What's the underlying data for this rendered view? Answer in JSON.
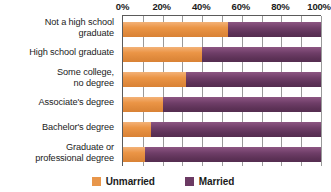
{
  "chart_data": {
    "type": "bar",
    "orientation": "horizontal",
    "stacked": true,
    "stack_total": 100,
    "title": "",
    "subtitle": "",
    "xlabel": "",
    "ylabel": "",
    "xlim": [
      0,
      100
    ],
    "grid": true,
    "grid_interval": 10,
    "tick_interval": 20,
    "axis_unit": "%",
    "legend_position": "bottom-center",
    "tick_labels": [
      "0%",
      "20%",
      "40%",
      "60%",
      "80%",
      "100%"
    ],
    "tick_values": [
      0,
      20,
      40,
      60,
      80,
      100
    ],
    "gridline_values": [
      0,
      10,
      20,
      30,
      40,
      50,
      60,
      70,
      80,
      90,
      100
    ],
    "categories": [
      "Not a high school graduate",
      "High school graduate",
      "Some college, no degree",
      "Associate's degree",
      "Bachelor's degree",
      "Graduate or professional degree"
    ],
    "category_label_lines": [
      [
        "Not a high school",
        "graduate"
      ],
      [
        "High school graduate"
      ],
      [
        "Some college,",
        "no degree"
      ],
      [
        "Associate's degree"
      ],
      [
        "Bachelor's degree"
      ],
      [
        "Graduate or",
        "professional degree"
      ]
    ],
    "series": [
      {
        "name": "Unmarried",
        "color": "#e8964a",
        "values": [
          53,
          40,
          32,
          20,
          14,
          11
        ]
      },
      {
        "name": "Married",
        "color": "#6b3a63",
        "values": [
          47,
          60,
          68,
          80,
          86,
          89
        ]
      }
    ]
  },
  "legend": {
    "items": [
      {
        "label": "Unmarried",
        "color": "#e8964a"
      },
      {
        "label": "Married",
        "color": "#6b3a63"
      }
    ]
  },
  "colors": {
    "unmarried": "#e8964a",
    "married": "#6b3a63",
    "axis": "#5a5a5a",
    "grid": "#9a9a9a",
    "text": "#1b1b1b",
    "background": "#ffffff"
  }
}
